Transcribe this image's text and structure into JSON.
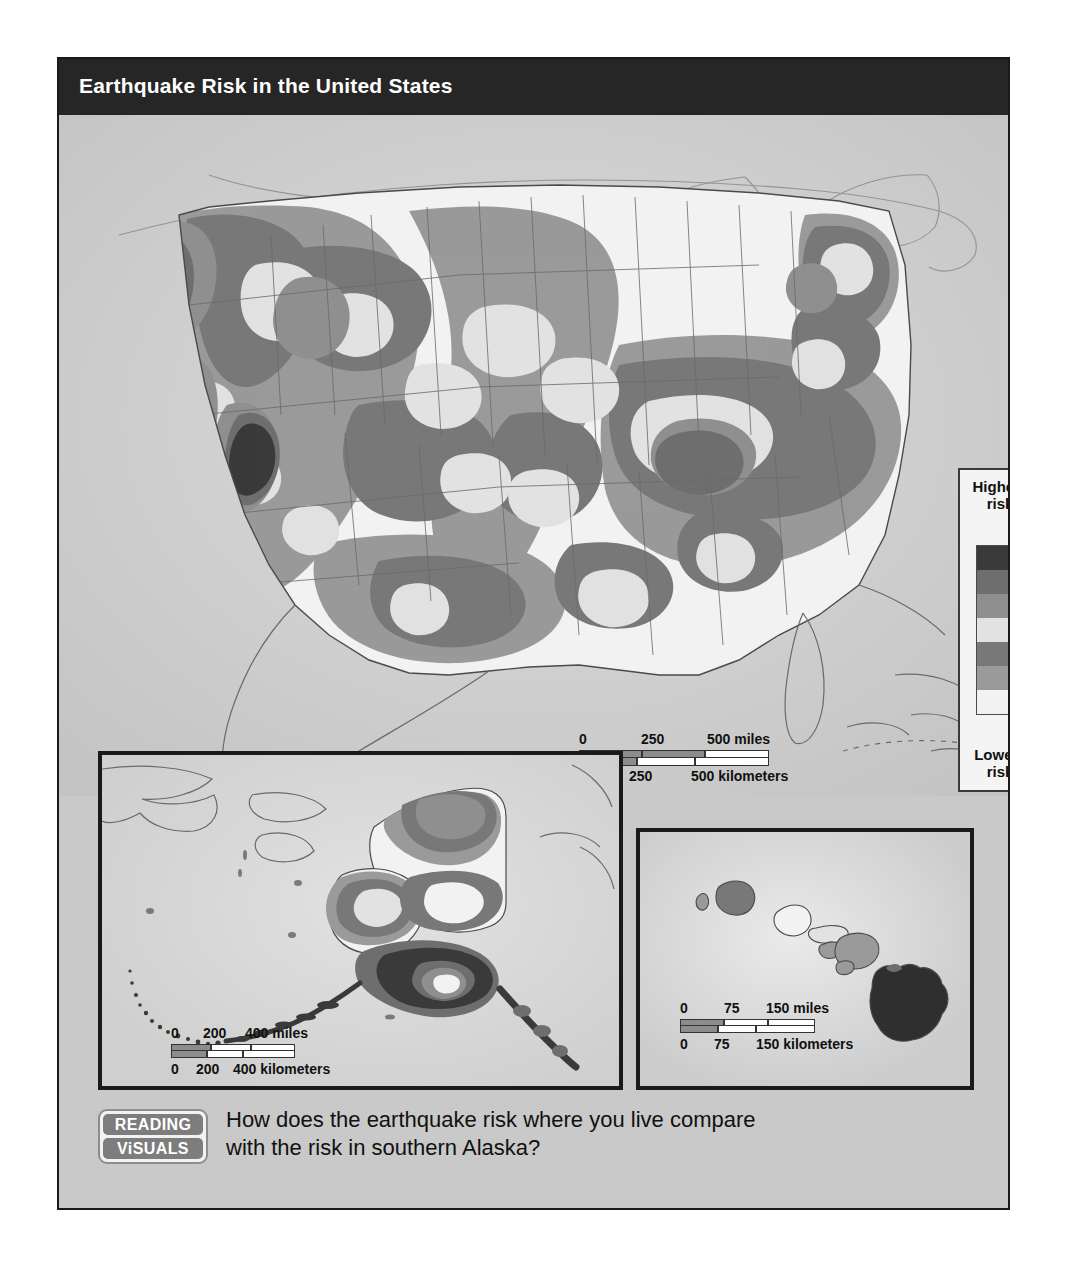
{
  "figure": {
    "title": "Earthquake Risk in the United States",
    "title_bg": "#262626",
    "title_color": "#ffffff",
    "frame_bg": "#c9c9c9",
    "frame_border": "#1a1a1a"
  },
  "legend": {
    "name": "earthquake-risk-legend",
    "top_label": "Highest\nrisk",
    "top_label_line1": "Highest",
    "top_label_line2": "risk",
    "bottom_label_line1": "Lowest",
    "bottom_label_line2": "risk",
    "bands": [
      {
        "rank": 1,
        "label": "Highest risk",
        "color": "#3a3a3a"
      },
      {
        "rank": 2,
        "label": "Very high risk",
        "color": "#6e6e6e"
      },
      {
        "rank": 3,
        "label": "High risk",
        "color": "#8f8f8f"
      },
      {
        "rank": 4,
        "label": "Moderate risk",
        "color": "#e2e2e2"
      },
      {
        "rank": 5,
        "label": "Low-moderate risk",
        "color": "#787878"
      },
      {
        "rank": 6,
        "label": "Low risk",
        "color": "#9a9a9a"
      },
      {
        "rank": 7,
        "label": "Lowest risk",
        "color": "#f2f2f2"
      }
    ]
  },
  "scales": {
    "main": {
      "miles": {
        "ticks": [
          "0",
          "250",
          "500"
        ],
        "unit": "500 miles",
        "label_0": "0",
        "label_mid": "250",
        "label_end": "500 miles"
      },
      "kilometers": {
        "label_0": "0",
        "label_mid": "250",
        "label_end": "500 kilometers"
      }
    },
    "alaska": {
      "miles": {
        "label_0": "0",
        "label_mid": "200",
        "label_end": "400 miles"
      },
      "kilometers": {
        "label_0": "0",
        "label_mid": "200",
        "label_end": "400 kilometers"
      }
    },
    "hawaii": {
      "miles": {
        "label_0": "0",
        "label_mid": "75",
        "label_end": "150 miles"
      },
      "kilometers": {
        "label_0": "0",
        "label_mid": "75",
        "label_end": "150 kilometers"
      }
    }
  },
  "insets": {
    "alaska": {
      "name": "alaska-inset"
    },
    "hawaii": {
      "name": "hawaii-inset"
    }
  },
  "caption": {
    "badge_line1": "READING",
    "badge_line2": "ViSUALS",
    "question_line1": "How does the earthquake risk where you live compare",
    "question_line2": "with the risk in southern Alaska?"
  },
  "map_data": {
    "type": "choropleth-contour-map",
    "region": "United States",
    "variable": "Earthquake risk (seismic hazard)",
    "classes": 7,
    "notable_high_risk_areas": [
      "Coastal California",
      "Pacific Northwest coast",
      "Nevada / Intermountain West",
      "New Madrid seismic zone (Missouri-Arkansas-Tennessee)",
      "Charleston, South Carolina",
      "Southern Alaska",
      "Island of Hawaii"
    ]
  }
}
